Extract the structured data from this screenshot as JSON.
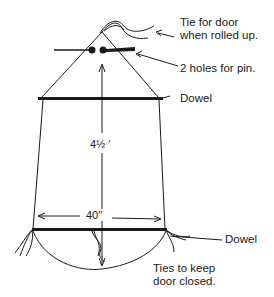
{
  "diagram": {
    "type": "door-pattern",
    "labels": {
      "tie_line1": "Tie for door",
      "tie_line2": "when rolled up.",
      "holes": "2 holes for pin.",
      "dowel_top": "Dowel",
      "dowel_bottom": "Dowel",
      "ties_line1": "Ties to keep",
      "ties_line2": "door closed."
    },
    "dimensions": {
      "height": "4½ ′",
      "width": "40″"
    },
    "colors": {
      "ink": "#1a1a1a",
      "background": "#ffffff"
    }
  }
}
